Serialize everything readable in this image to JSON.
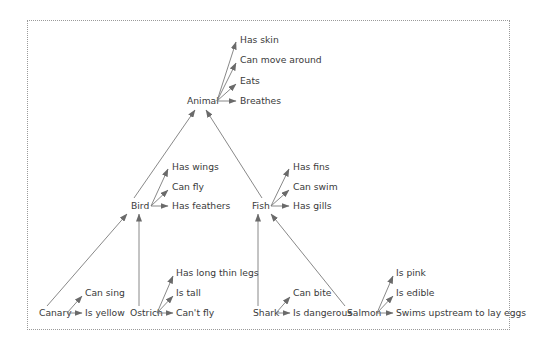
{
  "diagram": {
    "type": "semantic-network",
    "nodes": {
      "animal": {
        "label": "Animal",
        "properties": [
          "Has skin",
          "Can move around",
          "Eats",
          "Breathes"
        ]
      },
      "bird": {
        "label": "Bird",
        "properties": [
          "Has wings",
          "Can fly",
          "Has feathers"
        ]
      },
      "fish": {
        "label": "Fish",
        "properties": [
          "Has fins",
          "Can swim",
          "Has gills"
        ]
      },
      "canary": {
        "label": "Canary",
        "properties": [
          "Can sing",
          "Is yellow"
        ]
      },
      "ostrich": {
        "label": "Ostrich",
        "properties": [
          "Has long thin legs",
          "Is tall",
          "Can't fly"
        ]
      },
      "shark": {
        "label": "Shark",
        "properties": [
          "Can bite",
          "Is dangerous"
        ]
      },
      "salmon": {
        "label": "Salmon",
        "properties": [
          "Is pink",
          "Is edible",
          "Swims upstream to lay eggs"
        ]
      }
    },
    "isa_links": [
      {
        "from": "Bird",
        "to": "Animal"
      },
      {
        "from": "Fish",
        "to": "Animal"
      },
      {
        "from": "Canary",
        "to": "Bird"
      },
      {
        "from": "Ostrich",
        "to": "Bird"
      },
      {
        "from": "Shark",
        "to": "Fish"
      },
      {
        "from": "Salmon",
        "to": "Fish"
      }
    ],
    "colors": {
      "text": "#3a3a3a",
      "lines": "#7a7a7a",
      "border": "#9a9a9a"
    }
  }
}
